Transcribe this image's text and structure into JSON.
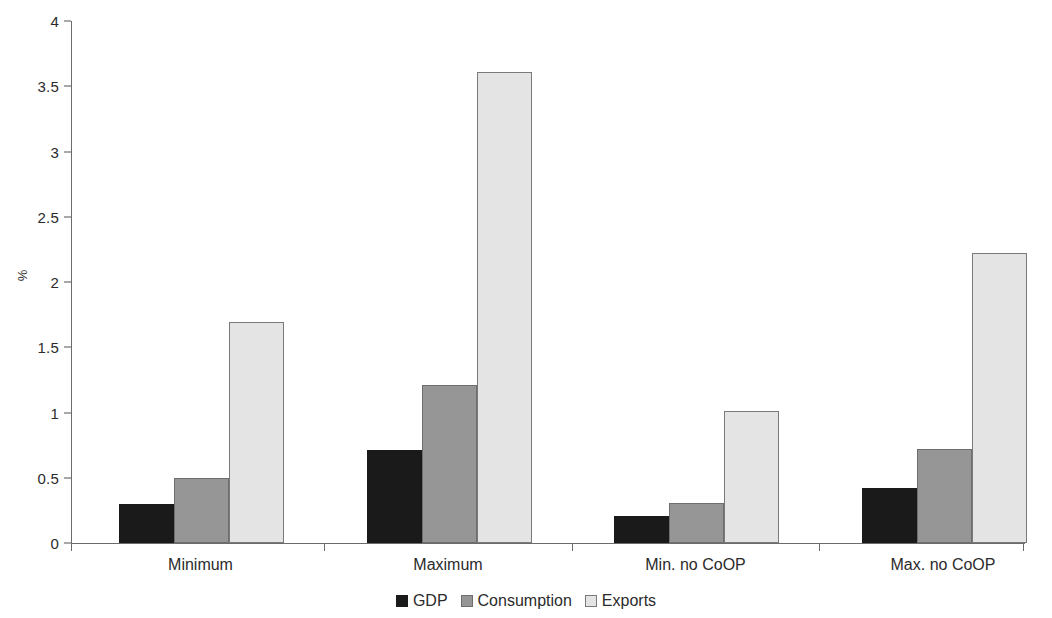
{
  "chart_data": {
    "type": "bar",
    "title": "",
    "subtitle": "",
    "xlabel": "",
    "ylabel": "%",
    "categories": [
      "Minimum",
      "Maximum",
      "Min. no CoOP",
      "Max. no CoOP"
    ],
    "series": [
      {
        "name": "GDP",
        "color": "#1a1a1a",
        "values": [
          0.3,
          0.71,
          0.21,
          0.42
        ]
      },
      {
        "name": "Consumption",
        "color": "#969696",
        "values": [
          0.5,
          1.21,
          0.31,
          0.72
        ]
      },
      {
        "name": "Exports",
        "color": "#e4e4e4",
        "values": [
          1.69,
          3.61,
          1.01,
          2.22
        ]
      }
    ],
    "ylim": [
      0,
      4
    ],
    "ytick_values": [
      0,
      0.5,
      1,
      1.5,
      2,
      2.5,
      3,
      3.5,
      4
    ],
    "ytick_labels": [
      "0",
      "0.5",
      "1",
      "1.5",
      "2",
      "2.5",
      "3",
      "3.5",
      "4"
    ],
    "grid": false,
    "legend_position": "bottom",
    "legend_entries": [
      "GDP",
      "Consumption",
      "Exports"
    ],
    "annotations": []
  }
}
